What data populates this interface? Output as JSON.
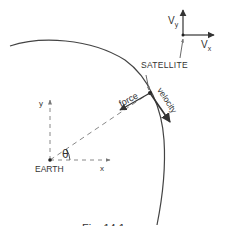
{
  "diagram": {
    "labels": {
      "satellite": "SATELLITE",
      "earth": "EARTH",
      "force": "force",
      "velocity": "velocity",
      "theta": "θ",
      "x_axis": "x",
      "y_axis": "y",
      "vx": "Vx",
      "vy": "Vy",
      "vx_main": "V",
      "vx_sub": "x",
      "vy_main": "V",
      "vy_sub": "y"
    },
    "caption": "Fig. 14.1",
    "colors": {
      "line": "#444444",
      "dashed": "#888888",
      "text": "#333333"
    }
  }
}
